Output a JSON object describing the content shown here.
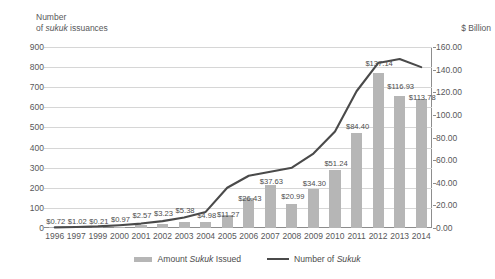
{
  "axes": {
    "left_title_line1": "Number",
    "left_title_line2_pre": "of ",
    "left_title_line2_em": "sukuk",
    "left_title_line2_post": " issuances",
    "right_title": "$ Billion"
  },
  "legend": {
    "bars_pre": "Amount ",
    "bars_em": "Sukuk",
    "bars_post": " Issued",
    "line_pre": "Number of ",
    "line_em": "Sukuk",
    "line_post": ""
  },
  "colors": {
    "bar": "#b6b6b6",
    "line": "#4a4a4a",
    "grid": "#d6d6d6",
    "axis": "#8d8d8d",
    "text": "#58585a"
  },
  "chart_data": {
    "type": "bar",
    "title": "",
    "subtitle": "",
    "xlabel": "",
    "ylabel": "Number of sukuk issuances",
    "y2label": "$ Billion",
    "grid": true,
    "legend_position": "bottom",
    "categories": [
      "1996",
      "1997",
      "1999",
      "2000",
      "2001",
      "2002",
      "2003",
      "2004",
      "2005",
      "2006",
      "2007",
      "2008",
      "2009",
      "2010",
      "2011",
      "2012",
      "2013",
      "2014"
    ],
    "ylim": [
      0,
      900
    ],
    "yticks": [
      "0",
      "100",
      "200",
      "300",
      "400",
      "500",
      "600",
      "700",
      "800",
      "900"
    ],
    "y2lim": [
      0,
      160
    ],
    "y2ticks": [
      "0.00",
      "20.00",
      "40.00",
      "60.00",
      "80.00",
      "100.00",
      "120.00",
      "140.00",
      "160.00"
    ],
    "series": [
      {
        "name": "Amount Sukuk Issued",
        "type": "bar",
        "axis": "right",
        "unit": "$ Billion",
        "values": [
          0.72,
          1.02,
          0.21,
          0.97,
          2.57,
          3.23,
          5.38,
          4.98,
          11.27,
          26.43,
          37.63,
          20.99,
          34.3,
          51.24,
          84.4,
          137.14,
          116.93,
          113.78
        ],
        "labels": [
          "$0.72",
          "$1.02",
          "$0.21",
          "$0.97",
          "$2.57",
          "$3.23",
          "$5.38",
          "$4.98",
          "$11.27",
          "$26.43",
          "$37.63",
          "$20.99",
          "$34.30",
          "$51.24",
          "$84.40",
          "$137.14",
          "$116.93",
          "$113.78"
        ]
      },
      {
        "name": "Number of Sukuk",
        "type": "line",
        "axis": "left",
        "unit": "issuances",
        "values": [
          3,
          5,
          8,
          14,
          22,
          34,
          52,
          80,
          200,
          260,
          280,
          300,
          370,
          480,
          680,
          820,
          840,
          800
        ]
      }
    ]
  }
}
